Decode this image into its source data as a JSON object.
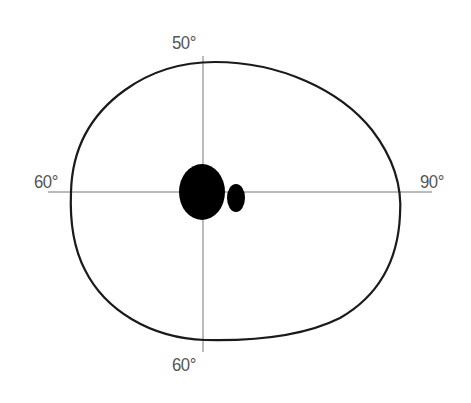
{
  "diagram": {
    "type": "visual-field-plot",
    "labels": {
      "top": "50°",
      "left": "60°",
      "right": "90°",
      "bottom": "60°"
    },
    "axes": {
      "horizontal": {
        "x1": 48,
        "x2": 432,
        "y": 192
      },
      "vertical": {
        "x": 203,
        "y1": 56,
        "y2": 352
      }
    },
    "field_boundary": {
      "shape": "closed-contour",
      "extent": {
        "top": 62,
        "left": 71,
        "right": 400,
        "bottom": 340
      }
    },
    "scotomas": [
      {
        "name": "blind-spot",
        "cx": 202,
        "cy": 192,
        "rx": 23,
        "ry": 28
      },
      {
        "name": "small-scotoma",
        "cx": 236,
        "cy": 198,
        "rx": 9,
        "ry": 14
      }
    ],
    "colors": {
      "contour": "#1a1a1a",
      "axis": "#777777",
      "label": "#555555",
      "fill": "#000000"
    }
  }
}
